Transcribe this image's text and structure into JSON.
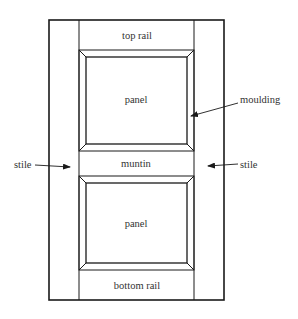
{
  "diagram": {
    "title": "",
    "type": "panelled door elevation",
    "labels": {
      "top_rail": "top rail",
      "top_panel": "panel",
      "moulding": "moulding",
      "stile_left": "stile",
      "stile_right": "stile",
      "muntin": "muntin",
      "bottom_panel": "panel",
      "bottom_rail": "bottom rail"
    },
    "colors": {
      "line": "#1a1a1a",
      "text": "#333333",
      "background": "#ffffff"
    }
  }
}
